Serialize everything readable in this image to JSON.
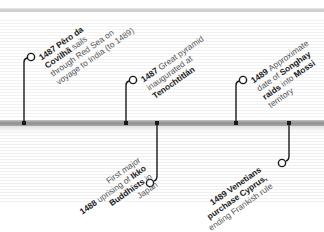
{
  "timeline": {
    "bar_color": "#999999",
    "line_color": "#1a1a1a",
    "events": [
      {
        "year": "1487",
        "lines": [
          [
            {
              "t": "1487 ",
              "b": true
            },
            {
              "t": "Pêro da",
              "b": true
            }
          ],
          [
            {
              "t": "Covilhã",
              "b": true
            },
            {
              "t": " sails",
              "b": false
            }
          ],
          [
            {
              "t": "through Red Sea on",
              "b": false
            }
          ],
          [
            {
              "t": "voyage to India (to 1489)",
              "b": false
            }
          ]
        ],
        "position": "above"
      },
      {
        "year": "1487",
        "lines": [
          [
            {
              "t": "1487 ",
              "b": true
            },
            {
              "t": "Great pyramid",
              "b": false
            }
          ],
          [
            {
              "t": "inaugurated at",
              "b": false
            }
          ],
          [
            {
              "t": "Tenochtitlán",
              "b": true
            }
          ]
        ],
        "position": "above"
      },
      {
        "year": "1489",
        "lines": [
          [
            {
              "t": "1489 ",
              "b": true
            },
            {
              "t": "Approximate",
              "b": false
            }
          ],
          [
            {
              "t": "date of ",
              "b": false
            },
            {
              "t": "Songhay",
              "b": true
            }
          ],
          [
            {
              "t": "raids",
              "b": true
            },
            {
              "t": " into ",
              "b": false
            },
            {
              "t": "Mossi",
              "b": true
            }
          ],
          [
            {
              "t": "territory",
              "b": false
            }
          ]
        ],
        "position": "above"
      },
      {
        "year": "1488",
        "lines": [
          [
            {
              "t": "First major",
              "b": false
            }
          ],
          [
            {
              "t": "uprising of ",
              "b": false
            },
            {
              "t": "Ikko",
              "b": true
            }
          ],
          [
            {
              "t": "Buddhists",
              "b": true
            },
            {
              "t": " in",
              "b": false
            }
          ],
          [
            {
              "t": "Japan",
              "b": false
            }
          ]
        ],
        "lead": "1488 ",
        "position": "below"
      },
      {
        "year": "1489",
        "lines": [
          [
            {
              "t": "1489 Venetians",
              "b": true
            }
          ],
          [
            {
              "t": "purchase Cyprus,",
              "b": true
            }
          ],
          [
            {
              "t": "ending Frankish rule",
              "b": false
            }
          ]
        ],
        "position": "below"
      }
    ]
  }
}
